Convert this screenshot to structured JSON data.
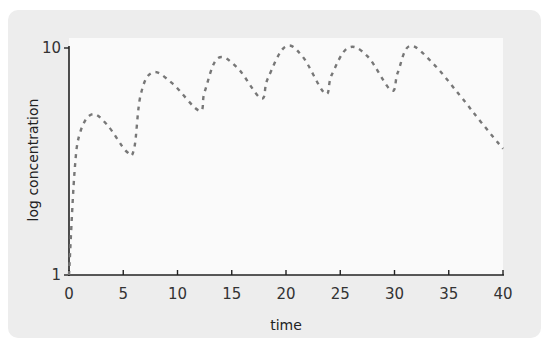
{
  "chart_data": {
    "type": "line",
    "title": "",
    "xlabel": "time",
    "ylabel": "log concentration",
    "x_ticks": [
      "0",
      "5",
      "10",
      "15",
      "20",
      "25",
      "30",
      "35",
      "40"
    ],
    "y_ticks": [
      "1",
      "10"
    ],
    "xlim": [
      0,
      40
    ],
    "ylim": [
      1,
      10
    ],
    "yscale": "log",
    "grid": false,
    "legend": null,
    "series": [
      {
        "name": "concentration",
        "style": "dashed",
        "color": "#777777",
        "points": [
          [
            0,
            1.0
          ],
          [
            0.5,
            2.8
          ],
          [
            1.0,
            4.2
          ],
          [
            2.1,
            5.1
          ],
          [
            3.5,
            4.6
          ],
          [
            5.3,
            3.5
          ],
          [
            6.0,
            3.6
          ],
          [
            6.6,
            6.2
          ],
          [
            7.7,
            7.8
          ],
          [
            9.5,
            7.0
          ],
          [
            12.0,
            5.3
          ],
          [
            12.5,
            6.4
          ],
          [
            13.7,
            9.0
          ],
          [
            15.5,
            8.2
          ],
          [
            17.7,
            6.0
          ],
          [
            18.3,
            7.3
          ],
          [
            19.9,
            10.1
          ],
          [
            21.5,
            9.2
          ],
          [
            23.6,
            6.3
          ],
          [
            24.2,
            7.6
          ],
          [
            25.7,
            10.0
          ],
          [
            27.5,
            9.2
          ],
          [
            29.7,
            6.5
          ],
          [
            30.3,
            7.8
          ],
          [
            31.4,
            10.2
          ],
          [
            33.5,
            8.6
          ],
          [
            36.0,
            6.2
          ],
          [
            38.0,
            4.7
          ],
          [
            40.0,
            3.6
          ]
        ]
      }
    ]
  }
}
